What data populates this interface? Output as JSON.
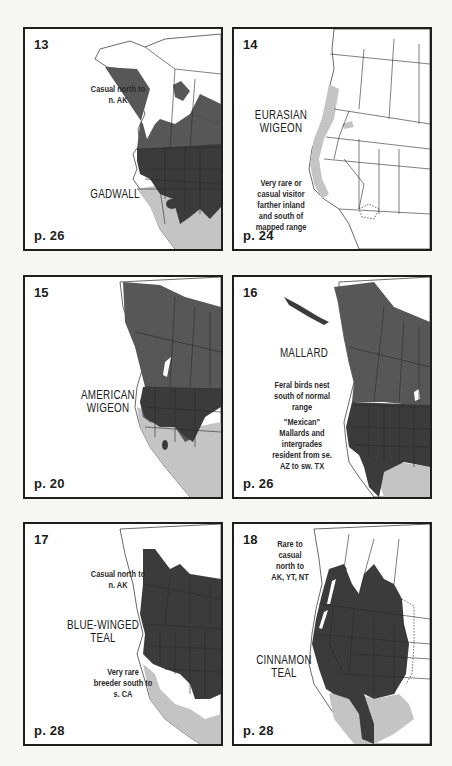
{
  "panels": [
    {
      "id": "13",
      "number": "13",
      "species": "GADWALL",
      "notes": [
        "Casual north to n. AK"
      ],
      "page": "p. 26"
    },
    {
      "id": "14",
      "number": "14",
      "species": "EURASIAN WIGEON",
      "notes": [
        "Very rare or casual visitor farther inland and south of mapped range"
      ],
      "page": "p. 24"
    },
    {
      "id": "15",
      "number": "15",
      "species": "AMERICAN WIGEON",
      "notes": [],
      "page": "p. 20"
    },
    {
      "id": "16",
      "number": "16",
      "species": "MALLARD",
      "notes": [
        "Feral birds nest south of normal range",
        "\"Mexican\" Mallards and intergrades resident from se. AZ to sw. TX"
      ],
      "page": "p. 26"
    },
    {
      "id": "17",
      "number": "17",
      "species": "BLUE-WINGED TEAL",
      "notes": [
        "Casual north to n. AK",
        "Very rare breeder south to s. CA"
      ],
      "page": "p. 28"
    },
    {
      "id": "18",
      "number": "18",
      "species": "CINNAMON TEAL",
      "notes": [
        "Rare to casual north to AK, YT, NT"
      ],
      "page": "p. 28"
    }
  ],
  "colors": {
    "breeding": "#575757",
    "year_round": "#3b3b3b",
    "winter": "#c4c4c4",
    "border": "#1e1e1e",
    "background": "#f7f7f5"
  }
}
